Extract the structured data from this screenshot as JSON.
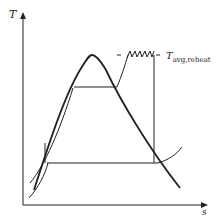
{
  "diagram": {
    "type": "T-s diagram, Rankine cycle with reheat",
    "y_axis_label": "T",
    "x_axis_label": "s",
    "annotation": {
      "main": "T",
      "subscript": "avg,reheat"
    }
  }
}
